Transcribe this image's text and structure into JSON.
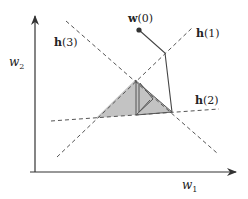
{
  "diagram": {
    "axes": {
      "x_label": "w",
      "x_sub": "1",
      "y_label": "w",
      "y_sub": "2"
    },
    "hyperplanes": [
      {
        "id": "h1",
        "label_bold": "h",
        "label_rest": "(1)"
      },
      {
        "id": "h2",
        "label_bold": "h",
        "label_rest": "(2)"
      },
      {
        "id": "h3",
        "label_bold": "h",
        "label_rest": "(3)"
      }
    ],
    "start_point": {
      "label_bold": "w",
      "label_rest": "(0)"
    },
    "colors": {
      "axis": "#333333",
      "dashed": "#555555",
      "region_fill": "#b8b8b8",
      "path": "#444444"
    }
  }
}
